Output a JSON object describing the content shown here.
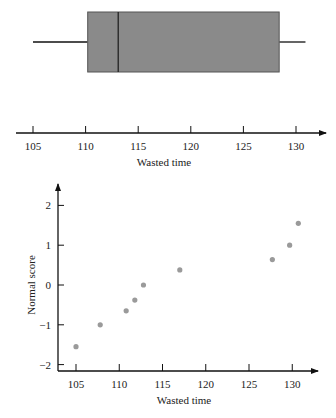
{
  "chart_data": [
    {
      "type": "box",
      "title": "",
      "xlabel": "Wasted time",
      "x_ticks": [
        105,
        110,
        115,
        120,
        125,
        130
      ],
      "xlim": [
        103,
        134
      ],
      "box": {
        "whisker_low": 105,
        "q1": 110.2,
        "median": 113.1,
        "q3": 128.4,
        "whisker_high": 130.9
      },
      "box_color": "#8a8a8a"
    },
    {
      "type": "scatter",
      "title": "",
      "xlabel": "Wasted time",
      "ylabel": "Normal score",
      "x_ticks": [
        105,
        110,
        115,
        120,
        125,
        130
      ],
      "y_ticks": [
        -2,
        -1,
        0,
        1,
        2
      ],
      "xlim": [
        103,
        134
      ],
      "ylim": [
        -2.2,
        2.5
      ],
      "points": [
        {
          "x": 105.0,
          "y": -1.55
        },
        {
          "x": 107.8,
          "y": -1.0
        },
        {
          "x": 110.8,
          "y": -0.65
        },
        {
          "x": 111.8,
          "y": -0.38
        },
        {
          "x": 112.8,
          "y": 0.0
        },
        {
          "x": 117.0,
          "y": 0.38
        },
        {
          "x": 127.7,
          "y": 0.64
        },
        {
          "x": 129.7,
          "y": 1.0
        },
        {
          "x": 130.7,
          "y": 1.55
        }
      ],
      "point_color": "#9a9a9a"
    }
  ],
  "labels": {
    "box_xlabel": "Wasted time",
    "scatter_xlabel": "Wasted time",
    "scatter_ylabel": "Normal score",
    "box_ticks": [
      "105",
      "110",
      "115",
      "120",
      "125",
      "130"
    ],
    "scatter_xticks": [
      "105",
      "110",
      "115",
      "120",
      "125",
      "130"
    ],
    "scatter_yticks": [
      "2",
      "1",
      "0",
      "−1",
      "−2"
    ]
  }
}
